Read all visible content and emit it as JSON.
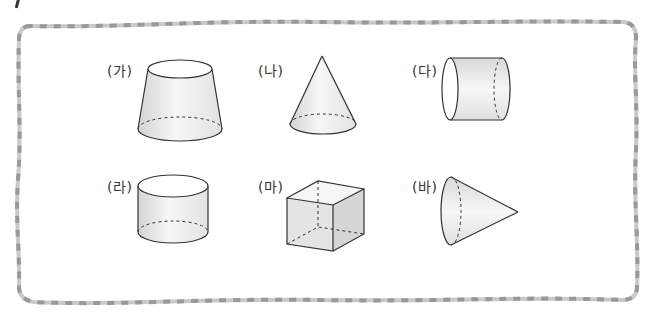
{
  "diagram": {
    "shapes": [
      {
        "label": "(가)",
        "name": "truncated-cone",
        "description": "원뿔대"
      },
      {
        "label": "(나)",
        "name": "cone",
        "description": "원뿔"
      },
      {
        "label": "(다)",
        "name": "cylinder-horizontal",
        "description": "원기둥 (옆으로 누운)"
      },
      {
        "label": "(라)",
        "name": "cylinder",
        "description": "원기둥"
      },
      {
        "label": "(마)",
        "name": "cube",
        "description": "정육면체"
      },
      {
        "label": "(바)",
        "name": "cone-horizontal",
        "description": "원뿔 (옆으로 누운)"
      }
    ]
  },
  "colors": {
    "border_dash_dark": "#9a9a9a",
    "border_dash_light": "#c8c8c8",
    "stroke": "#333333",
    "fill_light": "#f4f4f4",
    "fill_dark": "#d8d8d8"
  }
}
